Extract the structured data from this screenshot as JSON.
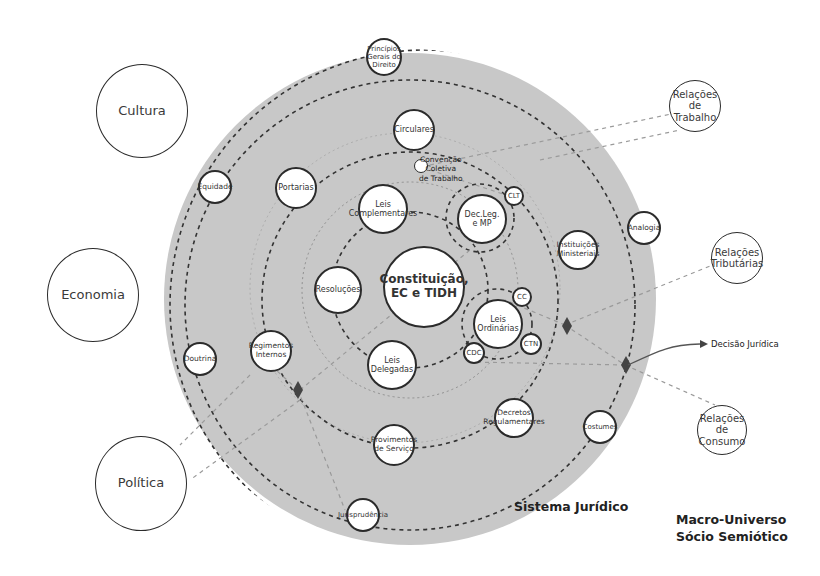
{
  "diagram": {
    "title_system": "Sistema Jurídico",
    "title_universe": "Macro-Universo\nSócio Semiótico",
    "decision_label": "Decisão Jurídica",
    "colors": {
      "system_fill": "#c8c8c8",
      "stroke": "#2b2b2b",
      "node_fill": "#ffffff",
      "dashed_connector": "#9a9a9a",
      "diamond": "#444444"
    },
    "center_node": "Constituição,\nEC e TIDH",
    "external_nodes": {
      "cultura": "Cultura",
      "economia": "Economia",
      "politica": "Política",
      "relacoes_trabalho": "Relações de\nTrabalho",
      "relacoes_tributarias": "Relações\nTributárias",
      "relacoes_consumo": "Relações de\nConsumo"
    },
    "nodes": {
      "principios": "Princípios\nGerais do\nDireito",
      "circulares": "Circulares",
      "convencao": "Convenção\nColetiva\nde Trabalho",
      "portarias": "Portarias",
      "equidade": "Equidade",
      "leis_complementares": "Leis\nComplementares",
      "dec_leg": "Dec.Leg.\ne MP",
      "clt": "CLT",
      "analogia": "Analogia",
      "instituicoes": "Instituições\nMinisteriais",
      "resolucoes": "Resoluções",
      "leis_ordinarias": "Leis\nOrdinárias",
      "cc": "CC",
      "ctn": "CTN",
      "cdc": "CDC",
      "regimentos": "Regimentos\nInternos",
      "doutrina": "Doutrina",
      "leis_delegadas": "Leis\nDelegadas",
      "decretos": "Decretos\nRegulamentares",
      "costumes": "Costumes",
      "provimentos": "Provimentos\nde Serviço",
      "jurisprudencia": "Jurisprudência"
    }
  }
}
